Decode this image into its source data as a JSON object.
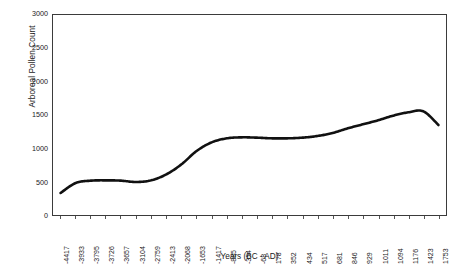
{
  "chart_data": {
    "type": "line",
    "title": "",
    "xlabel": "Years (BC - AD)",
    "ylabel": "Arboreal Pollen Count",
    "ylim": [
      0,
      3000
    ],
    "ytick_labels": [
      "3000",
      "2500",
      "2000",
      "1500",
      "1000",
      "500",
      "0"
    ],
    "ytick_values": [
      3000,
      2500,
      2000,
      1500,
      1000,
      500,
      0
    ],
    "grid": false,
    "legend": "none",
    "categories": [
      "-4417",
      "-3933",
      "-3795",
      "-3726",
      "-3657",
      "-3104",
      "-2759",
      "-2413",
      "-2068",
      "-1653",
      "-1417",
      "-885",
      "-354",
      "-68",
      "178",
      "352",
      "434",
      "517",
      "681",
      "846",
      "929",
      "1011",
      "1094",
      "1176",
      "1423",
      "1753"
    ],
    "series": [
      {
        "name": "Arboreal Pollen Count",
        "color": "#111111",
        "values": [
          330,
          480,
          515,
          520,
          515,
          495,
          520,
          610,
          760,
          960,
          1090,
          1150,
          1165,
          1160,
          1150,
          1150,
          1160,
          1185,
          1230,
          1300,
          1360,
          1420,
          1490,
          1540,
          1555,
          1350
        ]
      }
    ]
  }
}
